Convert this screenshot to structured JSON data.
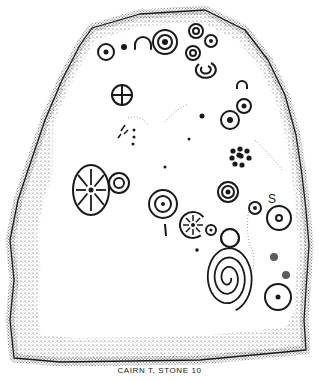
{
  "caption": "CAIRN T, STONE 10",
  "colors": {
    "ink": "#1a1a1a",
    "stipple": "#555555",
    "background": "#ffffff"
  },
  "stone_outline": [
    [
      92,
      28
    ],
    [
      140,
      14
    ],
    [
      205,
      10
    ],
    [
      245,
      30
    ],
    [
      268,
      60
    ],
    [
      285,
      95
    ],
    [
      296,
      135
    ],
    [
      302,
      175
    ],
    [
      306,
      210
    ],
    [
      309,
      245
    ],
    [
      306,
      290
    ],
    [
      304,
      320
    ],
    [
      306,
      350
    ],
    [
      200,
      360
    ],
    [
      60,
      362
    ],
    [
      14,
      358
    ],
    [
      10,
      320
    ],
    [
      14,
      280
    ],
    [
      10,
      240
    ],
    [
      18,
      200
    ],
    [
      28,
      170
    ],
    [
      45,
      120
    ],
    [
      62,
      80
    ],
    [
      80,
      45
    ]
  ],
  "carvings": [
    {
      "type": "ringdot",
      "name": "cup-and-ring-top-left",
      "cx": 106,
      "cy": 52,
      "r": [
        8
      ],
      "dot": 2.5
    },
    {
      "type": "dot",
      "name": "cup-mark",
      "cx": 124,
      "cy": 47,
      "r": 3
    },
    {
      "type": "arch",
      "name": "horseshoe-top",
      "cx": 143,
      "cy": 45,
      "r": 8
    },
    {
      "type": "ringdot",
      "name": "double-ring-top",
      "cx": 165,
      "cy": 42,
      "r": [
        12,
        7
      ],
      "dot": 3
    },
    {
      "type": "ringdot",
      "name": "ring-cluster-a",
      "cx": 196,
      "cy": 31,
      "r": [
        7,
        3
      ]
    },
    {
      "type": "ringdot",
      "name": "ring-cluster-b",
      "cx": 211,
      "cy": 41,
      "r": [
        6
      ],
      "dot": 2
    },
    {
      "type": "ringdot",
      "name": "ring-cluster-c",
      "cx": 193,
      "cy": 53,
      "r": [
        7,
        3
      ]
    },
    {
      "type": "hook",
      "name": "c-mark",
      "cx": 205,
      "cy": 72,
      "r": 10
    },
    {
      "type": "cross",
      "name": "wheel-cross",
      "cx": 122,
      "cy": 95,
      "r": 10
    },
    {
      "type": "arch",
      "name": "small-arch-right",
      "cx": 242,
      "cy": 86,
      "r": 5
    },
    {
      "type": "ringdot",
      "name": "ring-pair-a",
      "cx": 244,
      "cy": 106,
      "r": [
        7
      ],
      "dot": 2.5
    },
    {
      "type": "ringdot",
      "name": "ring-pair-b",
      "cx": 230,
      "cy": 120,
      "r": [
        9
      ],
      "dot": 3
    },
    {
      "type": "dot",
      "name": "lone-dot-a",
      "cx": 202,
      "cy": 116,
      "r": 2.5
    },
    {
      "type": "dot",
      "name": "lone-dot-b",
      "cx": 189,
      "cy": 139,
      "r": 1.5
    },
    {
      "type": "dot",
      "name": "lone-dot-c",
      "cx": 165,
      "cy": 167,
      "r": 1.5
    },
    {
      "type": "rosette",
      "name": "dot-rosette",
      "cx": 241,
      "cy": 156
    },
    {
      "type": "sunburst",
      "name": "oval-sunburst",
      "cx": 91,
      "cy": 190,
      "rx": 18,
      "ry": 25
    },
    {
      "type": "ringdot",
      "name": "ring-beside-sunburst",
      "cx": 119,
      "cy": 183,
      "r": [
        10,
        5
      ]
    },
    {
      "type": "ringdot",
      "name": "double-ring-centre",
      "cx": 163,
      "cy": 204,
      "r": [
        14,
        8
      ],
      "dot": 2
    },
    {
      "type": "line",
      "name": "vertical-stroke",
      "x1": 165,
      "y1": 224,
      "x2": 166,
      "y2": 236
    },
    {
      "type": "sunburst-small",
      "name": "small-wheel",
      "cx": 193,
      "cy": 225,
      "r": 13
    },
    {
      "type": "ringdot",
      "name": "tiny-ring",
      "cx": 211,
      "cy": 230,
      "r": [
        5
      ],
      "dot": 1.5
    },
    {
      "type": "ringdot",
      "name": "ring-with-arcs",
      "cx": 228,
      "cy": 192,
      "r": [
        10,
        6
      ],
      "dot": 2.5
    },
    {
      "type": "ringdot",
      "name": "small-ring-right",
      "cx": 255,
      "cy": 208,
      "r": [
        6
      ],
      "dot": 2
    },
    {
      "type": "ringdot",
      "name": "ring-far-right",
      "cx": 279,
      "cy": 218,
      "r": [
        12,
        3
      ]
    },
    {
      "type": "spiral",
      "name": "spiral",
      "cx": 228,
      "cy": 278,
      "rx": 22,
      "ry": 30
    },
    {
      "type": "ring",
      "name": "ring-above-spiral",
      "cx": 230,
      "cy": 238,
      "r": 9
    },
    {
      "type": "dot",
      "name": "dot-below-wheel",
      "cx": 197,
      "cy": 250,
      "r": 1.8
    },
    {
      "type": "blob",
      "name": "cup-right-a",
      "cx": 274,
      "cy": 257,
      "r": 4
    },
    {
      "type": "blob",
      "name": "cup-right-b",
      "cx": 286,
      "cy": 275,
      "r": 4
    },
    {
      "type": "ringdot",
      "name": "ring-bottom-right",
      "cx": 278,
      "cy": 297,
      "r": [
        13
      ],
      "dot": 2.5
    },
    {
      "type": "text",
      "name": "s-mark",
      "x": 268,
      "y": 203,
      "text": "S"
    }
  ]
}
